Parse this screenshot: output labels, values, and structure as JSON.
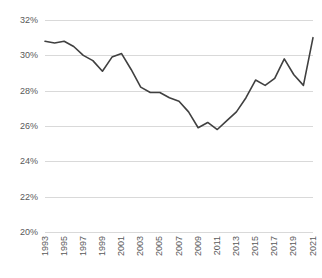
{
  "chart_data": {
    "type": "line",
    "title": "",
    "subtitle": "",
    "xlabel": "",
    "ylabel": "",
    "grid": true,
    "legend": false,
    "legend_position": "none",
    "line_color": "#404040",
    "gridline_color": "#D9D9D9",
    "text_color": "#595959",
    "xlim": [
      1993,
      2021
    ],
    "ylim": [
      20,
      32
    ],
    "y_tick_step": 2,
    "y_tick_labels": [
      "32%",
      "30%",
      "28%",
      "26%",
      "24%",
      "22%",
      "20%"
    ],
    "y_tick_values": [
      32,
      30,
      28,
      26,
      24,
      22,
      20
    ],
    "x_tick_labels": [
      "1993",
      "1995",
      "1997",
      "1999",
      "2001",
      "2003",
      "2005",
      "2007",
      "2009",
      "2011",
      "2013",
      "2015",
      "2017",
      "2019",
      "2021"
    ],
    "x_tick_values": [
      1993,
      1995,
      1997,
      1999,
      2001,
      2003,
      2005,
      2007,
      2009,
      2011,
      2013,
      2015,
      2017,
      2019,
      2021
    ],
    "x": [
      1993,
      1994,
      1995,
      1996,
      1997,
      1998,
      1999,
      2000,
      2001,
      2002,
      2003,
      2004,
      2005,
      2006,
      2007,
      2008,
      2009,
      2010,
      2011,
      2012,
      2013,
      2014,
      2015,
      2016,
      2017,
      2018,
      2019,
      2020,
      2021
    ],
    "values": [
      30.8,
      30.7,
      30.8,
      30.5,
      30.0,
      29.7,
      29.1,
      29.9,
      30.1,
      29.2,
      28.2,
      27.9,
      27.9,
      27.6,
      27.4,
      26.8,
      25.9,
      26.2,
      25.8,
      26.3,
      26.8,
      27.6,
      28.6,
      28.3,
      28.7,
      29.8,
      28.9,
      28.3,
      31.0
    ],
    "series": [
      {
        "name": "Series 1",
        "values": [
          30.8,
          30.7,
          30.8,
          30.5,
          30.0,
          29.7,
          29.1,
          29.9,
          30.1,
          29.2,
          28.2,
          27.9,
          27.9,
          27.6,
          27.4,
          26.8,
          25.9,
          26.2,
          25.8,
          26.3,
          26.8,
          27.6,
          28.6,
          28.3,
          28.7,
          29.8,
          28.9,
          28.3,
          31.0
        ]
      }
    ],
    "annotations": []
  }
}
